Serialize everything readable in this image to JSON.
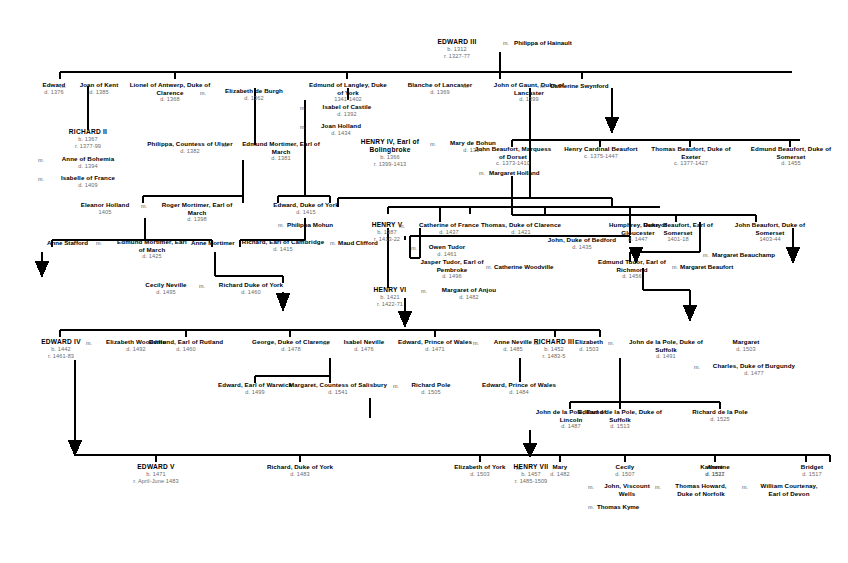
{
  "document": {
    "type": "genealogical-family-tree",
    "subject": "English royal descent from Edward III to the children of Henry VII",
    "marriage_symbol": "m.",
    "colors": {
      "line": "#000000",
      "name_text": "#000000",
      "date_text": "#6b6b6b",
      "background": "#ffffff"
    }
  },
  "generations": [
    {
      "id": "g1",
      "people": [
        {
          "name": "EDWARD III",
          "dates": [
            "b. 1312",
            "r. 1327-77"
          ],
          "king": true
        },
        {
          "name": "Philippa of Hainault",
          "spouse_of": "EDWARD III"
        }
      ]
    },
    {
      "id": "g2",
      "people": [
        {
          "name": "Edward",
          "dates": [
            "d. 1376"
          ]
        },
        {
          "name": "Joan of Kent",
          "dates": [
            "d. 1385"
          ]
        },
        {
          "name": "Lionel of Antwerp, Duke of Clarence",
          "dates": [
            "d. 1368"
          ]
        },
        {
          "name": "Elizabeth de Burgh",
          "dates": [
            "d. 1362"
          ]
        },
        {
          "name": "Edmund of Langley, Duke of York",
          "dates": [
            "1341-1402"
          ]
        },
        {
          "name": "Isabel of Castile",
          "dates": [
            "d. 1392"
          ]
        },
        {
          "name": "Joan Holland",
          "dates": [
            "d. 1434"
          ]
        },
        {
          "name": "Blanche of Lancaster",
          "dates": [
            "d. 1369"
          ]
        },
        {
          "name": "John of Gaunt, Duke of Lancaster",
          "dates": [
            "d. 1399"
          ]
        },
        {
          "name": "Catherine Swynford"
        }
      ]
    },
    {
      "id": "g3",
      "people": [
        {
          "name": "RICHARD II",
          "dates": [
            "b. 1367",
            "r. 1377-99"
          ],
          "king": true
        },
        {
          "name": "Anne of Bohemia",
          "dates": [
            "d. 1394"
          ]
        },
        {
          "name": "Isabelle of France",
          "dates": [
            "d. 1409"
          ]
        },
        {
          "name": "Philippa, Countess of Ulster",
          "dates": [
            "d. 1382"
          ]
        },
        {
          "name": "Edmund Mortimer, Earl of March",
          "dates": [
            "d. 1381"
          ]
        },
        {
          "name": "HENRY IV, Earl of Bolingbroke",
          "dates": [
            "b. 1366",
            "r. 1399-1413"
          ],
          "king": true
        },
        {
          "name": "Mary de Bohun",
          "dates": [
            "d. 1394"
          ]
        },
        {
          "name": "John Beaufort, Marquess of Dorset",
          "dates": [
            "c. 1373-1410"
          ]
        },
        {
          "name": "Margaret Holland"
        },
        {
          "name": "Henry Cardinal Beaufort",
          "dates": [
            "c. 1375-1447"
          ]
        },
        {
          "name": "Thomas Beaufort, Duke of Exeter",
          "dates": [
            "c. 1377-1427"
          ]
        },
        {
          "name": "Edmund Beaufort, Duke of Somerset",
          "dates": [
            "d. 1455"
          ]
        }
      ]
    },
    {
      "id": "g4",
      "people": [
        {
          "name": "Eleanor Holland",
          "dates": [
            "1405"
          ]
        },
        {
          "name": "Roger Mortimer, Earl of March",
          "dates": [
            "d. 1398"
          ]
        },
        {
          "name": "Edward, Duke of York",
          "dates": [
            "d. 1415"
          ]
        },
        {
          "name": "Philippa Mohun"
        }
      ]
    },
    {
      "id": "g5",
      "people": [
        {
          "name": "Anne Stafford"
        },
        {
          "name": "Edmund Mortimer, Earl of March",
          "dates": [
            "d. 1425"
          ]
        },
        {
          "name": "Anne Mortimer"
        },
        {
          "name": "Richard, Earl of Cambridge",
          "dates": [
            "d. 1415"
          ]
        },
        {
          "name": "Maud Clifford"
        },
        {
          "name": "HENRY V",
          "dates": [
            "b. 1387",
            "r. 1413-22"
          ],
          "king": true
        },
        {
          "name": "Catherine of France",
          "dates": [
            "d. 1437"
          ]
        },
        {
          "name": "Owen Tudor",
          "dates": [
            "d. 1461"
          ]
        },
        {
          "name": "Thomas, Duke of Clarence",
          "dates": [
            "d. 1421"
          ]
        },
        {
          "name": "John, Duke of Bedford",
          "dates": [
            "d. 1435"
          ]
        },
        {
          "name": "Humphrey, Duke of Gloucester",
          "dates": [
            "d. 1447"
          ]
        },
        {
          "name": "Henry Beaufort, Earl of Somerset",
          "dates": [
            "1401-18"
          ]
        },
        {
          "name": "John Beaufort, Duke of Somerset",
          "dates": [
            "1403-44"
          ]
        },
        {
          "name": "Margaret Beauchamp"
        }
      ]
    },
    {
      "id": "g6",
      "people": [
        {
          "name": "Cecily Neville",
          "dates": [
            "d. 1495"
          ]
        },
        {
          "name": "Richard Duke of York",
          "dates": [
            "d. 1460"
          ]
        },
        {
          "name": "Jasper Tudor, Earl of Pembroke",
          "dates": [
            "d. 1496"
          ]
        },
        {
          "name": "Catherine Woodville"
        },
        {
          "name": "Edmund Tudor, Earl of Richmond",
          "dates": [
            "d. 1456"
          ]
        },
        {
          "name": "Margaret Beaufort"
        },
        {
          "name": "HENRY VI",
          "dates": [
            "b. 1421",
            "r. 1422-71"
          ],
          "king": true
        },
        {
          "name": "Margaret of Anjou",
          "dates": [
            "d. 1482"
          ]
        }
      ]
    },
    {
      "id": "g7",
      "people": [
        {
          "name": "EDWARD IV",
          "dates": [
            "b. 1442",
            "r. 1461-83"
          ],
          "king": true
        },
        {
          "name": "Elizabeth Woodville",
          "dates": [
            "d. 1492"
          ]
        },
        {
          "name": "Edmund, Earl of Rutland",
          "dates": [
            "d. 1460"
          ]
        },
        {
          "name": "George, Duke of Clarence",
          "dates": [
            "d. 1478"
          ]
        },
        {
          "name": "Isabel Neville",
          "dates": [
            "d. 1476"
          ]
        },
        {
          "name": "Edward, Prince of Wales",
          "dates": [
            "d. 1471"
          ]
        },
        {
          "name": "Anne Neville",
          "dates": [
            "d. 1485"
          ]
        },
        {
          "name": "RICHARD III",
          "dates": [
            "b. 1452",
            "r. 1483-5"
          ],
          "king": true
        },
        {
          "name": "Elizabeth",
          "dates": [
            "d. 1503"
          ]
        },
        {
          "name": "John de la Pole, Duke of Suffolk",
          "dates": [
            "d. 1491"
          ]
        },
        {
          "name": "Margaret",
          "dates": [
            "d. 1503"
          ]
        },
        {
          "name": "Charles, Duke of Burgundy",
          "dates": [
            "d. 1477"
          ]
        }
      ]
    },
    {
      "id": "g8",
      "people": [
        {
          "name": "Edward, Earl of Warwick",
          "dates": [
            "d. 1499"
          ]
        },
        {
          "name": "Margaret, Countess of Salisbury",
          "dates": [
            "d. 1541"
          ]
        },
        {
          "name": "Richard Pole",
          "dates": [
            "d. 1505"
          ]
        },
        {
          "name": "Edward, Prince of Wales",
          "dates": [
            "d. 1484"
          ]
        },
        {
          "name": "John de la Pole, Earl of Lincoln",
          "dates": [
            "d. 1487"
          ]
        },
        {
          "name": "Edmund de la Pole, Duke of Suffolk",
          "dates": [
            "d. 1513"
          ]
        },
        {
          "name": "Richard de la Pole",
          "dates": [
            "d. 1525"
          ]
        }
      ]
    },
    {
      "id": "g9",
      "people": [
        {
          "name": "EDWARD V",
          "dates": [
            "b. 1471",
            "r. April-June 1483"
          ],
          "king": true
        },
        {
          "name": "Richard, Duke of York",
          "dates": [
            "d. 1483"
          ]
        },
        {
          "name": "Elizabeth of York",
          "dates": [
            "d. 1503"
          ]
        },
        {
          "name": "HENRY VII",
          "dates": [
            "b. 1457",
            "r. 1485-1509"
          ],
          "king": true
        },
        {
          "name": "Mary",
          "dates": [
            "d. 1482"
          ]
        },
        {
          "name": "Cecily",
          "dates": [
            "d. 1507"
          ]
        },
        {
          "name": "John, Viscount Wells"
        },
        {
          "name": "Thomas Kyme"
        },
        {
          "name": "Anne",
          "dates": [
            "d. 1511"
          ]
        },
        {
          "name": "Thomas Howard, Duke of Norfolk"
        },
        {
          "name": "Katherine",
          "dates": [
            "d. 1527"
          ]
        },
        {
          "name": "William Courtenay, Earl of Devon"
        },
        {
          "name": "Bridget",
          "dates": [
            "d. 1517"
          ]
        }
      ]
    }
  ],
  "nodes": {
    "edward_iii": {
      "name": "EDWARD III",
      "d1": "b. 1312",
      "d2": "r. 1327-77"
    },
    "philippa_hainault": {
      "name": "Philippa of Hainault"
    },
    "edward_bp": {
      "name": "Edward",
      "d1": "d. 1376"
    },
    "joan_kent": {
      "name": "Joan of Kent",
      "d1": "d. 1385"
    },
    "lionel": {
      "name": "Lionel of Antwerp, Duke of",
      "name2": "Clarence",
      "d1": "d. 1368"
    },
    "elizabeth_burgh": {
      "name": "Elizabeth de Burgh",
      "d1": "d. 1362"
    },
    "edmund_langley": {
      "name": "Edmund of Langley, Duke",
      "name2": "of York",
      "d1": "1341-1402"
    },
    "isabel_castile": {
      "name": "Isabel of Castile",
      "d1": "d. 1392"
    },
    "joan_holland": {
      "name": "Joan Holland",
      "d1": "d. 1434"
    },
    "blanche": {
      "name": "Blanche of Lancaster",
      "d1": "d. 1369"
    },
    "john_gaunt": {
      "name": "John of Gaunt, Duke of",
      "name2": "Lancaster",
      "d1": "d. 1399"
    },
    "catherine_swynford": {
      "name": "Catherine Swynford"
    },
    "richard_ii": {
      "name": "RICHARD II",
      "d1": "b. 1367",
      "d2": "r. 1377-99"
    },
    "anne_bohemia": {
      "name": "Anne of Bohemia",
      "d1": "d. 1394"
    },
    "isabelle_france": {
      "name": "Isabelle of France",
      "d1": "d. 1409"
    },
    "philippa_ulster": {
      "name": "Philippa, Countess of Ulster",
      "d1": "d. 1382"
    },
    "edmund_mortimer1": {
      "name": "Edmund Mortimer, Earl of",
      "name2": "March",
      "d1": "d. 1381"
    },
    "henry_iv": {
      "name": "HENRY IV, Earl of",
      "name2": "Bolingbroke",
      "d1": "b. 1366",
      "d2": "r. 1399-1413"
    },
    "mary_bohun": {
      "name": "Mary de Bohun",
      "d1": "d. 1394"
    },
    "john_beaufort_d": {
      "name": "John Beaufort, Marquess",
      "name2": "of Dorset",
      "d1": "c. 1373-1410"
    },
    "margaret_holland": {
      "name": "Margaret Holland"
    },
    "henry_cardinal": {
      "name": "Henry Cardinal Beaufort",
      "d1": "c. 1375-1447"
    },
    "thomas_beaufort": {
      "name": "Thomas Beaufort, Duke of",
      "name2": "Exeter",
      "d1": "c. 1377-1427"
    },
    "edmund_beaufort": {
      "name": "Edmund Beaufort, Duke of",
      "name2": "Somerset",
      "d1": "d. 1455"
    },
    "eleanor_holland": {
      "name": "Eleanor Holland",
      "d1": "1405"
    },
    "roger_mortimer": {
      "name": "Roger Mortimer, Earl of",
      "name2": "March",
      "d1": "d. 1398"
    },
    "edward_york": {
      "name": "Edward, Duke of York",
      "d1": "d. 1415"
    },
    "philippa_mohun": {
      "name": "Philippa Mohun"
    },
    "anne_stafford": {
      "name": "Anne Stafford"
    },
    "edmund_mortimer2": {
      "name": "Edmund Mortimer, Earl",
      "name2": "of March",
      "d1": "d. 1425"
    },
    "anne_mortimer": {
      "name": "Anne Mortimer"
    },
    "richard_cambridge": {
      "name": "Richard, Earl of Cambridge",
      "d1": "d. 1415"
    },
    "maud_clifford": {
      "name": "Maud Clifford"
    },
    "henry_v": {
      "name": "HENRY V",
      "d1": "b. 1387",
      "d2": "r. 1413-22"
    },
    "catherine_france": {
      "name": "Catherine of France",
      "d1": "d. 1437"
    },
    "owen_tudor": {
      "name": "Owen Tudor",
      "d1": "d. 1461"
    },
    "thomas_clarence": {
      "name": "Thomas, Duke of Clarence",
      "d1": "d. 1421"
    },
    "john_bedford": {
      "name": "John, Duke of Bedford",
      "d1": "d. 1435"
    },
    "humphrey": {
      "name": "Humphrey, Duke of",
      "name2": "Gloucester",
      "d1": "d. 1447"
    },
    "henry_beaufort_s": {
      "name": "Henry Beaufort, Earl of",
      "name2": "Somerset",
      "d1": "1401-18"
    },
    "john_beaufort_s": {
      "name": "John Beaufort, Duke of",
      "name2": "Somerset",
      "d1": "1403-44"
    },
    "margaret_beauchamp": {
      "name": "Margaret Beauchamp"
    },
    "cecily_neville": {
      "name": "Cecily Neville",
      "d1": "d. 1495"
    },
    "richard_york": {
      "name": "Richard Duke of York",
      "d1": "d. 1460"
    },
    "jasper_tudor": {
      "name": "Jasper Tudor, Earl of",
      "name2": "Pembroke",
      "d1": "d. 1496"
    },
    "catherine_woodville": {
      "name": "Catherine Woodville"
    },
    "edmund_tudor": {
      "name": "Edmund Tudor, Earl of",
      "name2": "Richmond",
      "d1": "d. 1456"
    },
    "margaret_beaufort": {
      "name": "Margaret Beaufort"
    },
    "henry_vi": {
      "name": "HENRY VI",
      "d1": "b. 1421",
      "d2": "r. 1422-71"
    },
    "margaret_anjou": {
      "name": "Margaret of Anjou",
      "d1": "d. 1482"
    },
    "edward_iv": {
      "name": "EDWARD IV",
      "d1": "b. 1442",
      "d2": "r. 1461-83"
    },
    "elizabeth_woodville": {
      "name": "Elizabeth Woodville",
      "d1": "d. 1492"
    },
    "edmund_rutland": {
      "name": "Edmund, Earl of Rutland",
      "d1": "d. 1460"
    },
    "george_clarence": {
      "name": "George, Duke of Clarence",
      "d1": "d. 1478"
    },
    "isabel_neville": {
      "name": "Isabel Neville",
      "d1": "d. 1476"
    },
    "edward_pow1": {
      "name": "Edward, Prince of Wales",
      "d1": "d. 1471"
    },
    "anne_neville": {
      "name": "Anne Neville",
      "d1": "d. 1485"
    },
    "richard_iii": {
      "name": "RICHARD III",
      "d1": "b. 1452",
      "d2": "r. 1483-5"
    },
    "elizabeth_suffolk": {
      "name": "Elizabeth",
      "d1": "d. 1503"
    },
    "john_pole_suffolk": {
      "name": "John de la Pole, Duke of",
      "name2": "Suffolk",
      "d1": "d. 1491"
    },
    "margaret_burgundy": {
      "name": "Margaret",
      "d1": "d. 1503"
    },
    "charles_burgundy": {
      "name": "Charles, Duke of Burgundy",
      "d1": "d. 1477"
    },
    "edward_warwick": {
      "name": "Edward, Earl of Warwick",
      "d1": "d. 1499"
    },
    "margaret_salisbury": {
      "name": "Margaret, Countess of Salisbury",
      "d1": "d. 1541"
    },
    "richard_pole": {
      "name": "Richard Pole",
      "d1": "d. 1505"
    },
    "edward_pow2": {
      "name": "Edward, Prince of Wales",
      "d1": "d. 1484"
    },
    "john_pole_lincoln": {
      "name": "John de la Pole, Earl of",
      "name2": "Lincoln",
      "d1": "d. 1487"
    },
    "edmund_pole": {
      "name": "Edmund de la Pole, Duke of",
      "name2": "Suffolk",
      "d1": "d. 1513"
    },
    "richard_pole_dlp": {
      "name": "Richard de la Pole",
      "d1": "d. 1525"
    },
    "edward_v": {
      "name": "EDWARD V",
      "d1": "b. 1471",
      "d2": "r. April-June 1483"
    },
    "richard_york_jr": {
      "name": "Richard, Duke of York",
      "d1": "d. 1483"
    },
    "elizabeth_of_york": {
      "name": "Elizabeth of York",
      "d1": "d. 1503"
    },
    "henry_vii": {
      "name": "HENRY VII",
      "d1": "b. 1457",
      "d2": "r. 1485-1509"
    },
    "mary": {
      "name": "Mary",
      "d1": "d. 1482"
    },
    "cecily": {
      "name": "Cecily",
      "d1": "d. 1507"
    },
    "john_wells": {
      "name": "John, Viscount",
      "name2": "Wells"
    },
    "thomas_kyme": {
      "name": "Thomas Kyme"
    },
    "anne": {
      "name": "Anne",
      "d1": "d. 1511"
    },
    "thomas_howard": {
      "name": "Thomas Howard,",
      "name2": "Duke of Norfolk"
    },
    "katherine": {
      "name": "Katherine",
      "d1": "d. 1527"
    },
    "william_courtenay": {
      "name": "William Courtenay,",
      "name2": "Earl of  Devon"
    },
    "bridget": {
      "name": "Bridget",
      "d1": "d. 1517"
    }
  },
  "marriage_marks": {
    "m": "m."
  }
}
